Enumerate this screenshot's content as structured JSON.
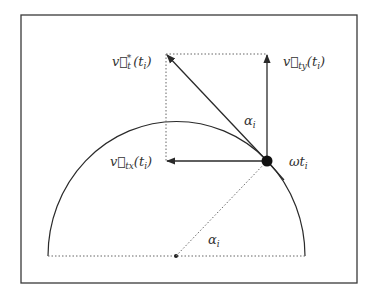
{
  "diagram": {
    "type": "velocity-decomposition-on-semicircle",
    "labels": {
      "v_t": {
        "base": "v⃗",
        "sub": "t",
        "sup": "*",
        "arg": "(t",
        "arg_sub": "i",
        "close": ")"
      },
      "v_ty": {
        "base": "v⃗",
        "sub": "ty",
        "arg": "(t",
        "arg_sub": "i",
        "close": ")"
      },
      "v_tx": {
        "base": "v⃗",
        "sub": "tx",
        "arg": "(t",
        "arg_sub": "i",
        "close": ")"
      },
      "omega_t": {
        "base": "ωt",
        "sub": "i"
      },
      "alpha_upper": {
        "base": "α",
        "sub": "i"
      },
      "alpha_lower": {
        "base": "α",
        "sub": "i"
      }
    },
    "colors": {
      "line": "#2a2a2a",
      "frame": "#3a3a3a",
      "dotted": "#666666"
    }
  }
}
